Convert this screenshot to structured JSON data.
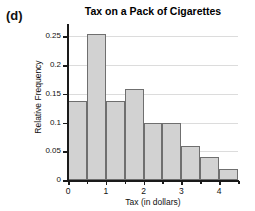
{
  "panel": {
    "label": "(d)"
  },
  "chart_data": {
    "type": "bar",
    "title": "Tax on a Pack of Cigarettes",
    "xlabel": "Tax (in dollars)",
    "ylabel": "Relative Frequency",
    "grid": true,
    "legend": "none",
    "bin_width": 0.5,
    "xlim": [
      0,
      4.5
    ],
    "ylim": [
      0,
      0.27
    ],
    "x_ticks": [
      0,
      1,
      2,
      3,
      4
    ],
    "x_tick_labels": [
      "0",
      "1",
      "2",
      "3",
      "4"
    ],
    "x_minor_ticks": [
      0.5,
      1.5,
      2.5,
      3.5,
      4.5
    ],
    "y_ticks": [
      0,
      0.05,
      0.1,
      0.15,
      0.2,
      0.25
    ],
    "y_tick_labels": [
      "0",
      "0.05",
      "0.1",
      "0.15",
      "0.2",
      "0.25"
    ],
    "bin_edges": [
      0,
      0.5,
      1,
      1.5,
      2,
      2.5,
      3,
      3.5,
      4,
      4.5
    ],
    "categories": [
      "0-0.5",
      "0.5-1",
      "1-1.5",
      "1.5-2",
      "2-2.5",
      "2.5-3",
      "3-3.5",
      "3.5-4",
      "4-4.5"
    ],
    "values": [
      0.138,
      0.255,
      0.138,
      0.158,
      0.1,
      0.1,
      0.06,
      0.04,
      0.02
    ],
    "bar_fill_color": "#d2d2d2",
    "bar_edge_color": "#6f6f6f"
  }
}
